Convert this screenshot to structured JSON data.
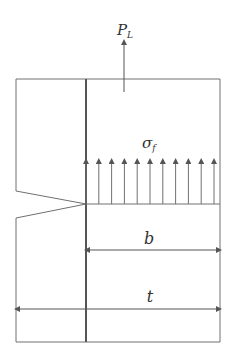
{
  "diagram": {
    "type": "notched specimen fracture stress diagram",
    "labels": {
      "load": "P",
      "load_sub": "L",
      "stress": "σ",
      "stress_sub": "f",
      "ligament_width": "b",
      "total_width": "t"
    },
    "colors": {
      "stroke": "#707070",
      "thick_stroke": "#555555",
      "text": "#333333",
      "background": "#ffffff"
    },
    "stress_arrow_count": 11
  }
}
